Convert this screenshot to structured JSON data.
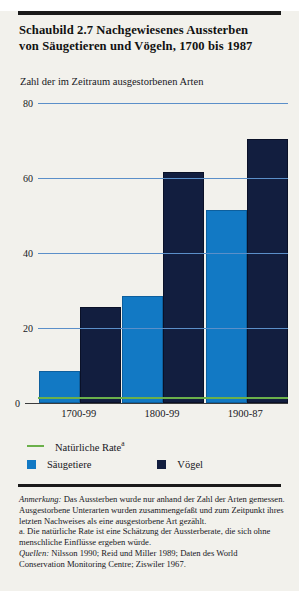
{
  "header": {
    "title_line1": "Schaubild 2.7   Nachgewiesenes Aussterben",
    "title_line2": "von Säugetieren und Vögeln, 1700 bis 1987"
  },
  "chart_data": {
    "type": "bar",
    "title": "Schaubild 2.7 Nachgewiesenes Aussterben von Säugetieren und Vögeln, 1700 bis 1987",
    "subtitle": "Zahl der im Zeitraum ausgestorbenen Arten",
    "xlabel": "",
    "ylabel": "Zahl der im Zeitraum ausgestorbenen Arten",
    "categories": [
      "1700-99",
      "1800-99",
      "1900-87"
    ],
    "series": [
      {
        "name": "Säugetiere",
        "color": "#1279c4",
        "values": [
          8,
          28,
          51
        ]
      },
      {
        "name": "Vögel",
        "color": "#121e3f",
        "values": [
          25,
          61,
          70
        ]
      }
    ],
    "reference_line": {
      "name": "Natürliche Rate",
      "footnote_marker": "a",
      "color": "#6bb04a",
      "value": 1
    },
    "ylim": [
      0,
      80
    ],
    "yticks": [
      0,
      20,
      40,
      60,
      80
    ],
    "ytick_labels": [
      "0",
      "20",
      "40",
      "60",
      "80"
    ],
    "grid": true,
    "gridline_color": "#5b8fc9",
    "legend_position": "bottom"
  },
  "legend": {
    "natural_rate": "Natürliche Rate",
    "natural_rate_marker": "a",
    "mammals": "Säugetiere",
    "birds": "Vögel"
  },
  "notes": {
    "anmerkung_label": "Anmerkung:",
    "anmerkung_text": " Das Aussterben wurde nur anhand der Zahl der Arten gemessen. Ausgestorbene Unterarten wurden zusammengefaßt und zum Zeitpunkt ihres letzten Nachweises als eine ausgestorbene Art gezählt.",
    "footnote_a": "a. Die natürliche Rate ist eine Schätzung der Aussterberate, die sich ohne menschliche Einflüsse ergeben würde.",
    "quellen_label": "Quellen:",
    "quellen_text": " Nilsson 1990; Reid und Miller 1989; Daten des World Conservation Monitoring Centre; Ziswiler 1967."
  }
}
